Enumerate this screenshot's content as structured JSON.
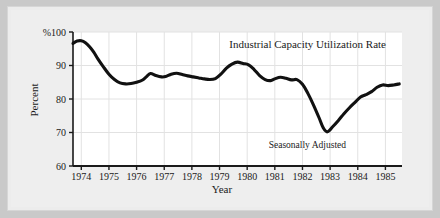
{
  "figure": {
    "background_color": "#c9c9c9",
    "paper_color": "#ececec",
    "plot_background_color": "#ffffff",
    "line_color": "#111111",
    "grid_color": "#e2e2e2",
    "axis_color": "#1a1a1a"
  },
  "chart_data": {
    "type": "line",
    "title": "Industrial Capacity Utilization Rate",
    "annotation": "Seasonally Adjusted",
    "xlabel": "Year",
    "ylabel": "Percent",
    "y_axis_top_label": "%100",
    "ytick_labels": [
      "%100",
      "90",
      "80",
      "70",
      "60"
    ],
    "yticks": [
      100,
      90,
      80,
      70,
      60
    ],
    "ylim": [
      60,
      100
    ],
    "xtick_labels": [
      "1974",
      "1975",
      "1976",
      "1977",
      "1978",
      "1979",
      "1980",
      "1981",
      "1982",
      "1983",
      "1984",
      "1985"
    ],
    "xticks": [
      1974,
      1975,
      1976,
      1977,
      1978,
      1979,
      1980,
      1981,
      1982,
      1983,
      1984,
      1985
    ],
    "xlim": [
      1973.7,
      1985.6
    ],
    "grid": true,
    "legend": "none",
    "series": [
      {
        "name": "Industrial Capacity Utilization Rate",
        "x": [
          1973.7,
          1973.85,
          1974.0,
          1974.15,
          1974.3,
          1974.45,
          1974.6,
          1974.8,
          1975.0,
          1975.2,
          1975.4,
          1975.6,
          1975.8,
          1976.0,
          1976.2,
          1976.35,
          1976.5,
          1976.7,
          1976.9,
          1977.05,
          1977.25,
          1977.45,
          1977.65,
          1977.85,
          1978.05,
          1978.25,
          1978.45,
          1978.65,
          1978.85,
          1979.05,
          1979.25,
          1979.45,
          1979.65,
          1979.85,
          1980.05,
          1980.25,
          1980.45,
          1980.65,
          1980.85,
          1981.0,
          1981.2,
          1981.4,
          1981.6,
          1981.8,
          1982.0,
          1982.2,
          1982.4,
          1982.6,
          1982.75,
          1982.9,
          1983.1,
          1983.3,
          1983.5,
          1983.7,
          1983.9,
          1984.1,
          1984.3,
          1984.5,
          1984.7,
          1984.9,
          1985.1,
          1985.3,
          1985.5
        ],
        "y": [
          96.6,
          97.3,
          97.4,
          96.8,
          95.6,
          94.0,
          92.0,
          89.6,
          87.4,
          85.8,
          84.8,
          84.5,
          84.6,
          85.0,
          85.6,
          86.6,
          87.6,
          87.0,
          86.6,
          86.7,
          87.4,
          87.7,
          87.3,
          86.9,
          86.6,
          86.3,
          86.0,
          85.8,
          86.1,
          87.4,
          89.2,
          90.4,
          91.0,
          90.6,
          90.2,
          88.8,
          87.0,
          85.8,
          85.5,
          86.0,
          86.5,
          86.2,
          85.7,
          85.8,
          84.4,
          81.6,
          78.2,
          74.4,
          71.4,
          70.2,
          71.8,
          73.6,
          75.6,
          77.4,
          79.0,
          80.6,
          81.3,
          82.2,
          83.5,
          84.2,
          84.0,
          84.2,
          84.5
        ]
      }
    ]
  }
}
